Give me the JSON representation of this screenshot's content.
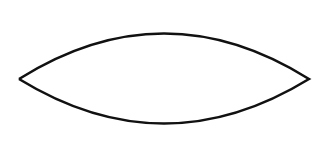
{
  "figure": {
    "shape_name": "lens-outline",
    "background_color": "#FFFFFF",
    "stroke_color": "#111111",
    "fill_color": "none",
    "stroke_width": 2.6,
    "canvas": {
      "width": 324,
      "height": 168
    },
    "geometry": {
      "left_vertex": {
        "x": 19,
        "y": 79
      },
      "right_vertex": {
        "x": 309,
        "y": 79
      },
      "top_apex": {
        "x": 164,
        "y": 23
      },
      "bottom_apex": {
        "x": 164,
        "y": 133
      },
      "width": 290,
      "height": 110,
      "upper_arc_control": {
        "x": 164,
        "y": -12
      },
      "lower_arc_control": {
        "x": 164,
        "y": 168
      },
      "path": "M 19 79 Q 164 -12 309 79 Q 164 168 19 79"
    }
  }
}
